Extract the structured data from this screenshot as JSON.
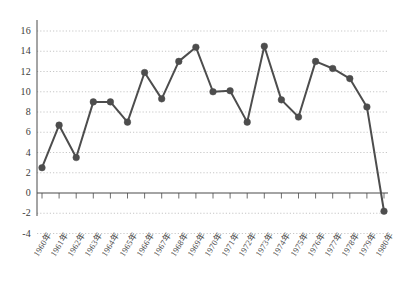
{
  "chart_data": {
    "type": "line",
    "title": "",
    "subtitle": "",
    "xlabel": "",
    "ylabel": "",
    "categories": [
      "1960年",
      "1961年",
      "1962年",
      "1963年",
      "1964年",
      "1965年",
      "1966年",
      "1967年",
      "1968年",
      "1969年",
      "1970年",
      "1971年",
      "1972年",
      "1973年",
      "1974年",
      "1975年",
      "1976年",
      "1977年",
      "1978年",
      "1979年",
      "1980年"
    ],
    "values": [
      2.5,
      6.7,
      3.5,
      9.0,
      9.0,
      7.0,
      11.9,
      9.3,
      13.0,
      14.4,
      10.0,
      10.1,
      7.0,
      14.5,
      9.2,
      7.5,
      13.0,
      12.3,
      11.3,
      8.5,
      -1.8
    ],
    "series": [
      {
        "name": "series-1",
        "values": [
          2.5,
          6.7,
          3.5,
          9.0,
          9.0,
          7.0,
          11.9,
          9.3,
          13.0,
          14.4,
          10.0,
          10.1,
          7.0,
          14.5,
          9.2,
          7.5,
          13.0,
          12.3,
          11.3,
          8.5,
          -1.8
        ]
      }
    ],
    "ylim": [
      -4,
      17
    ],
    "yticks": [
      16,
      14,
      12,
      10,
      8,
      6,
      4,
      2,
      0,
      -2,
      -4
    ],
    "ytick_labels": [
      "16",
      "14",
      "12",
      "10",
      "8",
      "6",
      "4",
      "2",
      "0",
      "-2",
      "-4"
    ],
    "grid": true,
    "grid_axis": "y",
    "grid_style": "dotted",
    "legend": false,
    "legend_position": "none",
    "marker": "circle",
    "line_color": "#4d4d4d",
    "marker_color": "#4d4d4d",
    "grid_color": "#b9b9b9",
    "axis_color": "#4a4a4a",
    "background_color": "#ffffff",
    "zero_line": true
  }
}
